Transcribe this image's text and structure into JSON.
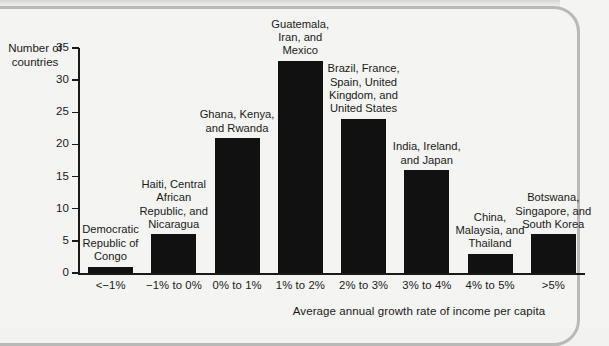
{
  "chart_data": {
    "type": "bar",
    "title": "",
    "xlabel": "Average annual growth rate of income per capita",
    "ylabel_line1": "Number of",
    "ylabel_line2": "countries",
    "categories": [
      "<−1%",
      "−1% to 0%",
      "0% to 1%",
      "1% to 2%",
      "2% to 3%",
      "3% to 4%",
      "4% to 5%",
      ">5%"
    ],
    "values": [
      1,
      6,
      21,
      33,
      24,
      16,
      3,
      6
    ],
    "bar_annotations": [
      "Democratic Republic of Congo",
      "Haiti, Central African Republic, and Nicaragua",
      "Ghana, Kenya, and Rwanda",
      "Guatemala, Iran, and Mexico",
      "Brazil, France, Spain, United Kingdom, and United States",
      "India, Ireland, and Japan",
      "China, Malaysia, and Thailand",
      "Botswana, Singapore, and South Korea"
    ],
    "yticks": [
      0,
      5,
      10,
      15,
      20,
      25,
      30,
      35
    ],
    "ytick_labels": [
      "0",
      "5",
      "10",
      "15",
      "20",
      "25",
      "30",
      "35"
    ],
    "ylim": [
      0,
      35
    ],
    "grid": false,
    "legend": "none",
    "bar_color": "#111111",
    "axis_color": "#1a1a1a",
    "background_color": "#f4f4f2"
  }
}
